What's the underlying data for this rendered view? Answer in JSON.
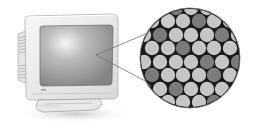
{
  "illustration": {
    "subject": "CRT monitor with magnified view of phosphor dots",
    "colors": {
      "background": "#ffffff",
      "monitor_body": "#ececec",
      "monitor_edge": "#9a9a9a",
      "screen_dark": "#8a8a8a",
      "screen_highlight": "#f4f4f4",
      "dot_light": "#c8c8c8",
      "dot_dark": "#7a7a7a",
      "dot_gap": "#1a1a1a",
      "shadow": "#d4d4d4"
    },
    "magnifier": {
      "cx": 190,
      "cy": 58,
      "r": 50
    },
    "dot_radius": 7.2
  }
}
